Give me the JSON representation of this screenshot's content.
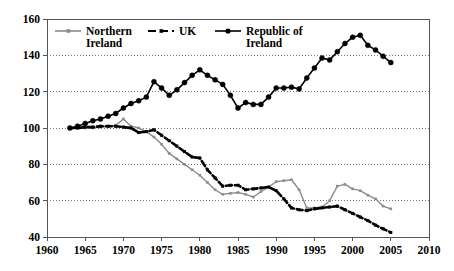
{
  "chart_data": {
    "type": "line",
    "title": "",
    "subtitle": "",
    "xlabel": "",
    "ylabel": "",
    "xlim": [
      1960,
      2010
    ],
    "ylim": [
      40,
      160
    ],
    "xticks": [
      1960,
      1965,
      1970,
      1975,
      1980,
      1985,
      1990,
      1995,
      2000,
      2005,
      2010
    ],
    "yticks": [
      40,
      60,
      80,
      100,
      120,
      140,
      160
    ],
    "xtick_labels": [
      "1960",
      "1965",
      "1970",
      "1975",
      "1980",
      "1985",
      "1990",
      "1995",
      "2000",
      "2005",
      "2010"
    ],
    "ytick_labels": [
      "40",
      "60",
      "80",
      "100",
      "120",
      "140",
      "160"
    ],
    "grid": true,
    "grid_style": "dotted-horizontal",
    "legend_position": "top-left-inside",
    "series": [
      {
        "name": "Northern Ireland",
        "color": "#8c8c8c",
        "line_style": "solid",
        "marker": "square",
        "x": [
          1963,
          1964,
          1965,
          1966,
          1967,
          1968,
          1969,
          1970,
          1971,
          1972,
          1973,
          1974,
          1975,
          1976,
          1977,
          1978,
          1979,
          1980,
          1981,
          1982,
          1983,
          1984,
          1985,
          1986,
          1987,
          1988,
          1989,
          1990,
          1991,
          1992,
          1993,
          1994,
          1995,
          1996,
          1997,
          1998,
          1999,
          2000,
          2001,
          2002,
          2003,
          2004,
          2005
        ],
        "values": [
          100,
          100,
          100,
          100,
          100.5,
          101,
          101.5,
          105,
          101,
          100,
          98,
          95,
          91,
          86,
          83,
          80,
          77,
          74,
          70,
          66,
          63.5,
          64,
          64.5,
          63.5,
          62,
          65,
          67.5,
          70.5,
          71,
          71.5,
          66,
          56,
          56,
          56.5,
          60,
          68,
          69,
          66.5,
          65.5,
          63,
          61,
          57,
          55.5
        ]
      },
      {
        "name": "UK",
        "color": "#000000",
        "line_style": "dashed",
        "marker": "square",
        "x": [
          1963,
          1964,
          1965,
          1966,
          1967,
          1968,
          1969,
          1970,
          1971,
          1972,
          1973,
          1974,
          1975,
          1976,
          1977,
          1978,
          1979,
          1980,
          1981,
          1982,
          1983,
          1984,
          1985,
          1986,
          1987,
          1988,
          1989,
          1990,
          1991,
          1992,
          1993,
          1994,
          1995,
          1996,
          1997,
          1998,
          1999,
          2000,
          2001,
          2002,
          2003,
          2004,
          2005
        ],
        "values": [
          100,
          100,
          100.5,
          100.5,
          101,
          101,
          101,
          100.5,
          100,
          97.5,
          98,
          99,
          96,
          93,
          90,
          87,
          84,
          83.5,
          77,
          72.5,
          68,
          68.5,
          68.5,
          66,
          66.5,
          67,
          67.5,
          65.5,
          61,
          56,
          55,
          54.5,
          55.5,
          56,
          56.5,
          57,
          55,
          53,
          51,
          49,
          46.5,
          44.5,
          42.5
        ]
      },
      {
        "name": "Republic of Ireland",
        "color": "#000000",
        "line_style": "solid",
        "marker": "circle",
        "x": [
          1963,
          1964,
          1965,
          1966,
          1967,
          1968,
          1969,
          1970,
          1971,
          1972,
          1973,
          1974,
          1975,
          1976,
          1977,
          1978,
          1979,
          1980,
          1981,
          1982,
          1983,
          1984,
          1985,
          1986,
          1987,
          1988,
          1989,
          1990,
          1991,
          1992,
          1993,
          1994,
          1995,
          1996,
          1997,
          1998,
          1999,
          2000,
          2001,
          2002,
          2003,
          2004,
          2005
        ],
        "values": [
          100,
          101,
          102.5,
          104,
          105,
          106.5,
          108,
          111,
          113.5,
          115,
          117,
          125.5,
          122,
          118,
          121,
          125,
          129,
          132,
          129,
          126.5,
          124,
          118,
          111,
          114,
          113,
          113,
          117,
          122,
          122,
          122.5,
          121.5,
          127.5,
          133,
          138.5,
          137.5,
          142,
          146.5,
          150,
          151,
          145.5,
          143,
          139.5,
          136
        ]
      }
    ]
  },
  "legend": {
    "items": [
      {
        "label_line1": "Northern",
        "label_line2": "Ireland",
        "series": "Northern Ireland"
      },
      {
        "label_line1": "UK",
        "label_line2": "",
        "series": "UK"
      },
      {
        "label_line1": "Republic of",
        "label_line2": "Ireland",
        "series": "Republic of Ireland"
      }
    ]
  },
  "colors": {
    "northern_ireland": "#8c8c8c",
    "uk": "#000000",
    "republic_of_ireland": "#000000",
    "axis": "#555555",
    "grid": "#777777",
    "background": "#ffffff"
  }
}
